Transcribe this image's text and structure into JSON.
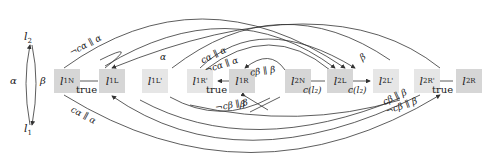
{
  "diagram": {
    "type": "state-transition-graph",
    "left_cycle": {
      "top_node": "l2",
      "bottom_node": "l1",
      "left_label": "α",
      "right_label": "β"
    },
    "nodes": [
      {
        "id": "l1N",
        "base": "l",
        "sub": "1",
        "sup": "N",
        "shaded": true
      },
      {
        "id": "l1L",
        "base": "l",
        "sub": "1",
        "sup": "L",
        "shaded": true
      },
      {
        "id": "l1L'",
        "base": "l",
        "sub": "1",
        "sup": "L'",
        "shaded": true
      },
      {
        "id": "l1R'",
        "base": "l",
        "sub": "1",
        "sup": "R'",
        "shaded": true
      },
      {
        "id": "l1R",
        "base": "l",
        "sub": "1",
        "sup": "R",
        "shaded": true
      },
      {
        "id": "l2N",
        "base": "l",
        "sub": "2",
        "sup": "N",
        "shaded": true
      },
      {
        "id": "l2L",
        "base": "l",
        "sub": "2",
        "sup": "L",
        "shaded": true
      },
      {
        "id": "l2L'",
        "base": "l",
        "sub": "2",
        "sup": "L'",
        "shaded": true
      },
      {
        "id": "l2R'",
        "base": "l",
        "sub": "2",
        "sup": "R'",
        "shaded": true
      },
      {
        "id": "l2R",
        "base": "l",
        "sub": "2",
        "sup": "R",
        "shaded": true
      }
    ],
    "edge_labels": {
      "true_1": "true",
      "true_2": "true",
      "true_3": "true",
      "c_l2_left": "c(l₂)",
      "c_l2_right": "c(l₂)",
      "neg_ca_alpha_top": "¬cα ∥ α",
      "ca_alpha_bottom": "cα ∥ α",
      "alpha_top": "α",
      "ca_alpha_mid": "cα ∥ α",
      "neg_ca_alpha_mid": "¬cα ∥ α",
      "cb_beta_loop": "cβ ∥ β",
      "beta_top": "β",
      "beta_mid": "β",
      "neg_cb_beta_mid": "¬cβ ∥ β",
      "cb_beta_right": "cβ ∥ β",
      "neg_cb_beta_right": "¬cβ ∥ β"
    }
  }
}
